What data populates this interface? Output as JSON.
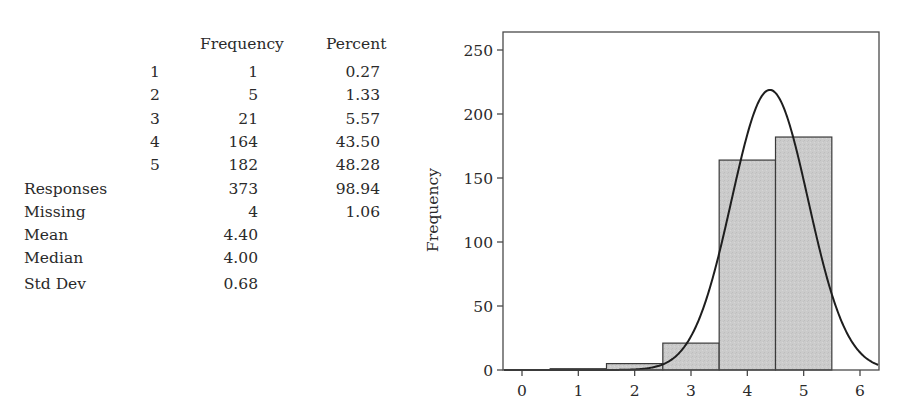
{
  "title_fragment": "",
  "table": {
    "headers": {
      "frequency": "Frequency",
      "percent": "Percent"
    },
    "rows": [
      {
        "value": "1",
        "frequency": "1",
        "percent": "0.27"
      },
      {
        "value": "2",
        "frequency": "5",
        "percent": "1.33"
      },
      {
        "value": "3",
        "frequency": "21",
        "percent": "5.57"
      },
      {
        "value": "4",
        "frequency": "164",
        "percent": "43.50"
      },
      {
        "value": "5",
        "frequency": "182",
        "percent": "48.28"
      }
    ],
    "summary": [
      {
        "label": "Responses",
        "frequency": "373",
        "percent": "98.94"
      },
      {
        "label": "Missing",
        "frequency": "4",
        "percent": "1.06"
      },
      {
        "label": "Mean",
        "frequency": "4.40",
        "percent": ""
      },
      {
        "label": "Median",
        "frequency": "4.00",
        "percent": ""
      },
      {
        "label": "Std Dev",
        "frequency": "0.68",
        "percent": ""
      }
    ]
  },
  "chart_data": {
    "type": "bar",
    "subtype": "histogram with fitted normal curve",
    "title": "",
    "xlabel": "",
    "ylabel": "Frequency",
    "categories": [
      "1",
      "2",
      "3",
      "4",
      "5"
    ],
    "values": [
      1,
      5,
      21,
      164,
      182
    ],
    "x_ticks": [
      "0",
      "1",
      "2",
      "3",
      "4",
      "5",
      "6"
    ],
    "y_ticks": [
      "0",
      "50",
      "100",
      "150",
      "200",
      "250"
    ],
    "xlim": [
      -0.34,
      6.34
    ],
    "ylim": [
      0,
      264
    ],
    "grid": false,
    "legend": null,
    "normal_fit": {
      "mean": 4.4,
      "std": 0.68,
      "n": 373,
      "bin_width": 1
    },
    "colors": {
      "bar_fill": "#cbcbcb",
      "bar_edge": "#3a3a3a",
      "curve": "#1e1e1e",
      "axis": "#4a4a4a"
    }
  }
}
